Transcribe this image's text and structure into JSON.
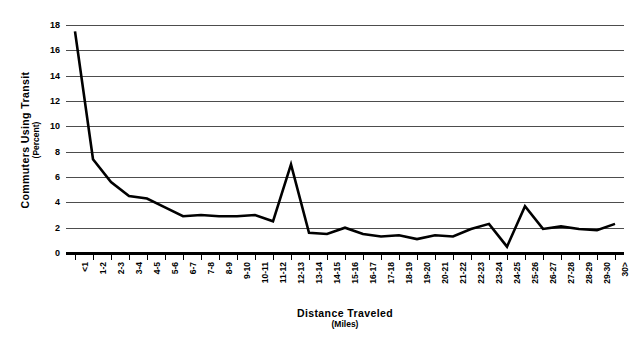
{
  "chart_data": {
    "type": "line",
    "title": "",
    "xlabel": "Distance Traveled",
    "xlabel_sub": "(Miles)",
    "ylabel": "Commuters Using Transit",
    "ylabel_sub": "(Percent)",
    "ylim": [
      0,
      18
    ],
    "ytick_step": 2,
    "ytick_labels": [
      "0",
      "2",
      "4",
      "6",
      "8",
      "10",
      "12",
      "14",
      "16",
      "18"
    ],
    "grid": true,
    "grid_axis": "y",
    "legend": false,
    "legend_position": "none",
    "line_color": "#000000",
    "grid_color": "#4d4d4d",
    "background_color": "#ffffff",
    "categories": [
      "<1",
      "1-2",
      "2-3",
      "3-4",
      "4-5",
      "5-6",
      "6-7",
      "7-8",
      "8-9",
      "9-10",
      "10-11",
      "11-12",
      "12-13",
      "13-14",
      "14-15",
      "15-16",
      "16-17",
      "17-18",
      "18-19",
      "19-20",
      "20-21",
      "21-22",
      "22-23",
      "23-24",
      "24-25",
      "25-26",
      "26-27",
      "27-28",
      "28-29",
      "29-30",
      "30>"
    ],
    "values": [
      17.5,
      7.4,
      5.6,
      4.5,
      4.3,
      3.6,
      2.9,
      3.0,
      2.9,
      2.9,
      3.0,
      2.5,
      7.0,
      1.6,
      1.5,
      2.0,
      1.5,
      1.3,
      1.4,
      1.1,
      1.4,
      1.3,
      1.9,
      2.3,
      0.5,
      3.7,
      1.9,
      2.1,
      1.9,
      1.8,
      2.3
    ],
    "series": [
      {
        "name": "Commuters Using Transit",
        "values": [
          17.5,
          7.4,
          5.6,
          4.5,
          4.3,
          3.6,
          2.9,
          3.0,
          2.9,
          2.9,
          3.0,
          2.5,
          7.0,
          1.6,
          1.5,
          2.0,
          1.5,
          1.3,
          1.4,
          1.1,
          1.4,
          1.3,
          1.9,
          2.3,
          0.5,
          3.7,
          1.9,
          2.1,
          1.9,
          1.8,
          2.3
        ]
      }
    ]
  }
}
